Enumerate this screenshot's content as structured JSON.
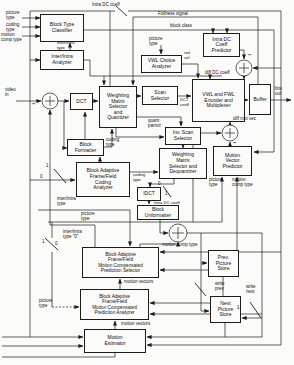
{
  "boxes": {
    "block_type_classifier": "Block Type\nClassifier",
    "inter_intra_analyzer": "Inter/Intra\nAnalyzer",
    "intra_dc_predictor": "Intra DC\nCoeff\nPredictor",
    "vwl_choice_analyzer": "VWL Choice\nAnalyzer",
    "dct": "DCT",
    "weighting_quantizer": "Weighting\nMatrix\nSelector\nand\nQuantizer",
    "scan_selector": "Scan\nSelector",
    "vwl_fwl_encoder": "VWL and FWL\nEncoder and\nMultiplexer",
    "buffer": "Buffer",
    "inv_scan_selector": "Inv. Scan\nSelector",
    "weighting_dequantizer": "Weighting\nMatrix\nSelector and\nDequantizer",
    "motion_vector_predictor": "Motion\nVector\nPredictor",
    "block_formatter": "Block\nFormatter",
    "coding_analyzer": "Block Adaptive\nFrame/Field\nCoding\nAnalyzer",
    "idct": "IDCT",
    "block_unformatter": "Block\nUnformatter",
    "prediction_selector": "Block Adaptive\nFrame/Field\nMotion Compensated\nPrediction Selector",
    "prediction_analyzer": "Block Adaptive\nFrame/Field\nMotion Compensated\nPrediction Analyzer",
    "motion_estimator": "Motion\nEstimator",
    "prev_picture_store": "Prev.\nPicture\nStore",
    "next_picture_store": "Next\nPicture\nStore"
  },
  "labels": {
    "picture_type_tl": "picture\ntype",
    "coding_type_tl": "coding\ntype",
    "motion_comp_tl": "motion\ncomp type",
    "intra_dc_top": "Intra DC coeff",
    "fullness": "Fullness signal",
    "block_class": "block class",
    "inter_intra_clf": "inter/intra\ntype",
    "picture_type_vwl": "picture\ntype",
    "vwl_sel": "vwl\nsel",
    "diff_dc": "diff DC coeff",
    "video_in": "video\nin",
    "bits_out": "bits\nout",
    "dct_coeff": "DCT\ncoeff",
    "quant_parmtr": "quant\nparmtr",
    "diff_mot_vec": "diff mot vec",
    "coding_type_fmt": "coding\ntype",
    "coding_type_deq": "coding\ntype",
    "intra_dc_idct": "Intra DC coeff",
    "inter_intra_left": "inter/intra\ntype",
    "picture_type_left": "picture\ntype",
    "inter_intra_0": "inter/intra\ntype \"0\"",
    "motion_comp_mid": "motion comp type",
    "motion_vectors_1": "motion vectors",
    "motion_vectors_2": "motion vectors",
    "picture_type_bl": "picture\ntype",
    "write_prev": "write\nprev",
    "write_next": "write\nnext",
    "picture_type_mvp": "picture\ntype",
    "motion_comp_mvp": "motion\ncomp type",
    "minus": "−",
    "sw_fmt_1": "1",
    "sw_fmt_0": "0",
    "sw_idct_0": "0",
    "sw_idct_1": "1",
    "sw_bl_1": "1",
    "sw_bl_0": "0",
    "sw_next_1": "1"
  },
  "colors": {
    "line": "#1c1c1c",
    "background": "#fbfbfa",
    "text": "#111111"
  }
}
